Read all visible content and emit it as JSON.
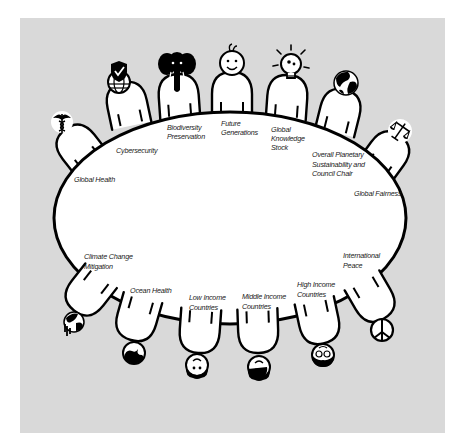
{
  "diagram": {
    "type": "council-table",
    "background_color": "#d9d9d9",
    "table_color": "#ffffff",
    "stroke_color": "#000000",
    "table": {
      "shape": "ellipse",
      "cx": 230,
      "cy": 218,
      "rx": 176,
      "ry": 106
    },
    "seats": [
      {
        "id": "global-health",
        "label_lines": [
          "Global Health"
        ],
        "icon": "caduceus-icon",
        "side": "top"
      },
      {
        "id": "cybersecurity",
        "label_lines": [
          "Cybersecurity"
        ],
        "icon": "shield-check-globe-icon",
        "side": "top"
      },
      {
        "id": "biodiversity",
        "label_lines": [
          "Biodiversity",
          "Preservation"
        ],
        "icon": "elephant-icon",
        "side": "top"
      },
      {
        "id": "future-generations",
        "label_lines": [
          "Future",
          "Generations"
        ],
        "icon": "baby-face-icon",
        "side": "top"
      },
      {
        "id": "global-knowledge",
        "label_lines": [
          "Global",
          "Knowledge",
          "Stock"
        ],
        "icon": "lightbulb-icon",
        "side": "top"
      },
      {
        "id": "planetary-sustainability",
        "label_lines": [
          "Overall Planetary",
          "Sustainability and",
          "Council Chair"
        ],
        "icon": "earth-globe-icon",
        "side": "top"
      },
      {
        "id": "global-fairness",
        "label_lines": [
          "Global Fairness"
        ],
        "icon": "scales-of-justice-icon",
        "side": "top"
      },
      {
        "id": "international-peace",
        "label_lines": [
          "International",
          "Peace"
        ],
        "icon": "peace-sign-icon",
        "side": "bottom"
      },
      {
        "id": "high-income",
        "label_lines": [
          "High Income",
          "Countries"
        ],
        "icon": "bearded-glasses-face-icon",
        "side": "bottom"
      },
      {
        "id": "middle-income",
        "label_lines": [
          "Middle Income",
          "Countries"
        ],
        "icon": "person-face-icon",
        "side": "bottom"
      },
      {
        "id": "low-income",
        "label_lines": [
          "Low Income",
          "Countries"
        ],
        "icon": "person-face-icon",
        "side": "bottom"
      },
      {
        "id": "ocean-health",
        "label_lines": [
          "Ocean Health"
        ],
        "icon": "ocean-wave-icon",
        "side": "bottom"
      },
      {
        "id": "climate-change",
        "label_lines": [
          "Climate Change",
          "Mitigation"
        ],
        "icon": "melting-earth-icon",
        "side": "bottom"
      }
    ]
  }
}
